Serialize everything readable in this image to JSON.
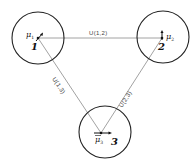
{
  "diagram": {
    "type": "network-graph",
    "nodes": [
      {
        "id": "1",
        "number_label": "1",
        "mu_label": "μ",
        "mu_subscript": "1",
        "vector_direction": "up-right"
      },
      {
        "id": "2",
        "number_label": "2",
        "mu_label": "μ",
        "mu_subscript": "2",
        "vector_direction": "up"
      },
      {
        "id": "3",
        "number_label": "3",
        "mu_label": "μ",
        "mu_subscript": "3",
        "vector_direction": "right"
      }
    ],
    "edges": [
      {
        "from": "1",
        "to": "2",
        "label": "U(1,2)"
      },
      {
        "from": "1",
        "to": "3",
        "label": "U(1,3)"
      },
      {
        "from": "2",
        "to": "3",
        "label": "U(2,3)"
      }
    ],
    "colors": {
      "circle_stroke": "#222222",
      "edge_stroke": "#8a8a8a",
      "text": "#111111"
    }
  }
}
